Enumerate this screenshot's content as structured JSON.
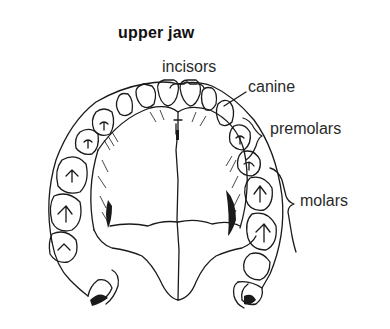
{
  "title": "upper jaw",
  "labels": {
    "incisors": "incisors",
    "canine": "canine",
    "premolars": "premolars",
    "molars": "molars"
  },
  "colors": {
    "ink": "#1a1a1a",
    "background": "#ffffff"
  }
}
